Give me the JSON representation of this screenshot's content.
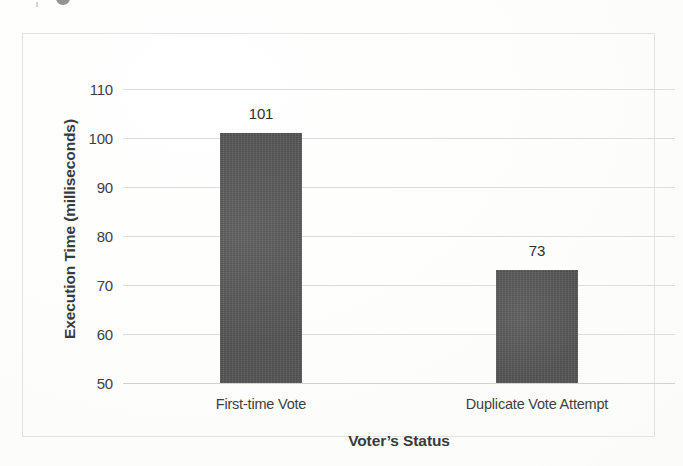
{
  "figure": {
    "background_color": "#fdfdfc",
    "frame_color": "#e2e2e2",
    "caption_fragment": ""
  },
  "chart_data": {
    "type": "bar",
    "title": "",
    "subtitle": "",
    "xlabel": "Voter’s Status",
    "ylabel": "Execution Time (milliseconds)",
    "categories": [
      "First-time Vote",
      "Duplicate Vote Attempt"
    ],
    "values": [
      101,
      73
    ],
    "data_labels": [
      "101",
      "73"
    ],
    "ylim": [
      50,
      110
    ],
    "yticks": [
      110,
      100,
      90,
      80,
      70,
      60,
      50
    ],
    "ytick_labels": [
      "110",
      "100",
      "90",
      "80",
      "70",
      "60",
      "50"
    ],
    "grid": true,
    "grid_axis": "y",
    "grid_color": "#dcdcdc",
    "legend": false,
    "legend_position": "none",
    "bar_color": "#595959",
    "bar_count": 2,
    "series": [
      {
        "name": "Execution Time",
        "values": [
          101,
          73
        ]
      }
    ],
    "units": "milliseconds"
  }
}
